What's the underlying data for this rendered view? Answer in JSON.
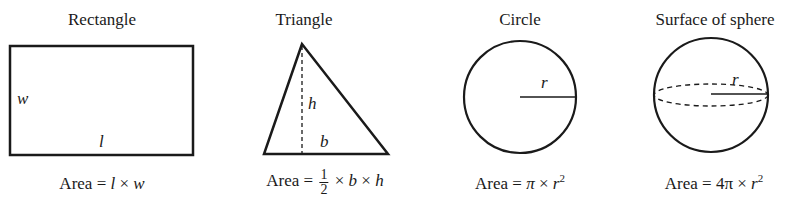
{
  "figures": [
    {
      "id": "rectangle",
      "title": "Rectangle",
      "labels": {
        "side_w": "w",
        "side_l": "l"
      },
      "formula": {
        "prefix": "Area = ",
        "terms": [
          "l",
          " × ",
          "w"
        ]
      }
    },
    {
      "id": "triangle",
      "title": "Triangle",
      "labels": {
        "height": "h",
        "base": "b"
      },
      "formula": {
        "prefix": "Area = ",
        "frac_num": "1",
        "frac_den": "2",
        "terms": [
          " × ",
          "b",
          " × ",
          "h"
        ]
      }
    },
    {
      "id": "circle",
      "title": "Circle",
      "labels": {
        "radius": "r"
      },
      "formula": {
        "prefix": "Area = ",
        "pi": "π",
        "times": " × ",
        "var": "r",
        "exp": "2"
      }
    },
    {
      "id": "sphere",
      "title": "Surface of sphere",
      "labels": {
        "radius": "r"
      },
      "formula": {
        "prefix": "Area = ",
        "coef": "4π",
        "times": " × ",
        "var": "r",
        "exp": "2"
      }
    }
  ],
  "colors": {
    "stroke": "#1a1a1a",
    "background": "#ffffff"
  }
}
